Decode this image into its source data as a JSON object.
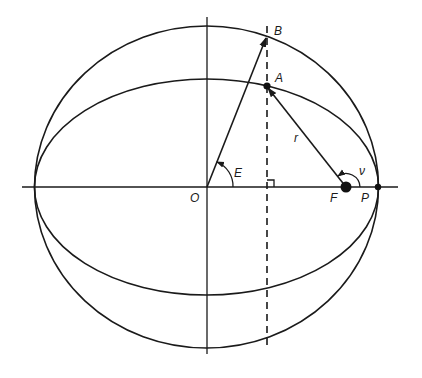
{
  "diagram": {
    "labels": {
      "B": "B",
      "A": "A",
      "r": "r",
      "E": "E",
      "O": "O",
      "F": "F",
      "P": "P",
      "nu": "ν"
    },
    "elements": [
      "auxiliary circle",
      "ellipse (orbit)",
      "major axis",
      "minor axis",
      "dashed perpendicular through A and B",
      "radius vector O to B",
      "radius vector F to A",
      "eccentric anomaly angle E",
      "true anomaly angle ν",
      "focus F",
      "pericenter P",
      "right angle marker"
    ],
    "colors": {
      "ink": "#1a1a1a",
      "background": "#ffffff"
    }
  }
}
